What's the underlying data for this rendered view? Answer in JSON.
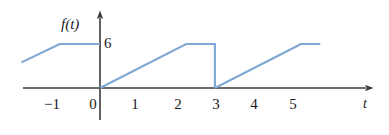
{
  "figure": {
    "name": "piecewise-periodic-waveform-graph",
    "background_color": "#ffffff"
  },
  "axes": {
    "y_axis_label": "f(t)",
    "x_axis_label": "t",
    "value_label_y6": "6",
    "x_tick_labels": [
      "−1",
      "0",
      "1",
      "2",
      "3",
      "4",
      "5"
    ],
    "x_tick_values": [
      -1,
      0,
      1,
      2,
      3,
      4,
      5
    ],
    "axis_color": "#3a3a3a",
    "curve_color": "#7fa8d4"
  },
  "chart_data": {
    "type": "line",
    "title": "",
    "xlabel": "t",
    "ylabel": "f(t)",
    "xlim": [
      -2.05,
      7.15
    ],
    "ylim": [
      -0.85,
      8.3
    ],
    "grid": false,
    "legend": null,
    "series": [
      {
        "name": "f(t)",
        "color": "#7fa8d4",
        "segments": [
          {
            "comment": "rising ramp entering from left, reaching the 6-level",
            "x": [
              -2.05,
              -1.05
            ],
            "y": [
              3.5,
              6.0
            ]
          },
          {
            "comment": "flat top at 6 from t=-1.05 to the vertical axis at t=0",
            "x": [
              -1.05,
              0.0
            ],
            "y": [
              6.0,
              6.0
            ]
          },
          {
            "comment": "ramp rising from 0 at t=0 to 6 at t=2.25",
            "x": [
              0.0,
              2.25
            ],
            "y": [
              0.0,
              6.0
            ]
          },
          {
            "comment": "flat top at 6 from t=2.25 to t=3",
            "x": [
              2.25,
              3.0
            ],
            "y": [
              6.0,
              6.0
            ]
          },
          {
            "comment": "vertical drop from 6 to 0 at t=3",
            "x": [
              3.0,
              3.0
            ],
            "y": [
              6.0,
              0.0
            ]
          },
          {
            "comment": "ramp rising from 0 at t=3 to 6 at t=5.25",
            "x": [
              3.0,
              5.25
            ],
            "y": [
              0.0,
              6.0
            ]
          },
          {
            "comment": "flat top at 6 from t=5.25 to t=5.75",
            "x": [
              5.25,
              5.75
            ],
            "y": [
              6.0,
              6.0
            ]
          }
        ]
      }
    ],
    "annotations": [
      {
        "text": "6",
        "x": 0.12,
        "y": 6.0,
        "note": "value label marking the 6 level on the f(t) axis"
      }
    ]
  }
}
